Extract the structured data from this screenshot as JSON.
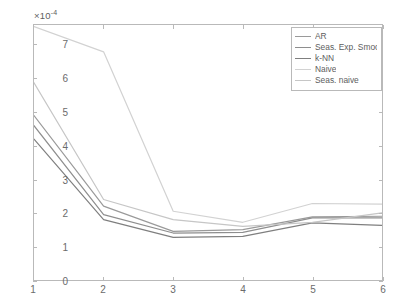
{
  "figure": {
    "title": "",
    "exponent_label": "×10",
    "exponent_value": "-4",
    "background_color": "#ffffff",
    "axis_color": "#b9b9b9"
  },
  "axes": {
    "y_ticks": [
      "0",
      "1",
      "2",
      "3",
      "4",
      "5",
      "6",
      "7"
    ],
    "x_ticks": [
      "1",
      "2",
      "3",
      "4",
      "5",
      "6"
    ],
    "ylabel": "",
    "xlabel": ""
  },
  "legend": {
    "position": "top-right",
    "entries": [
      {
        "label": "AR",
        "color": "#9a9a9a"
      },
      {
        "label": "Seas. Exp. Smooth.",
        "color": "#8e8e8e"
      },
      {
        "label": "k-NN",
        "color": "#7f7f7f"
      },
      {
        "label": "Naive",
        "color": "#d2d2d2"
      },
      {
        "label": "Seas. naive",
        "color": "#c6c6c6"
      }
    ]
  },
  "chart_data": {
    "type": "line",
    "title": "",
    "xlabel": "",
    "ylabel": "",
    "x": [
      1,
      2,
      3,
      4,
      5,
      6
    ],
    "xlim": [
      1,
      6
    ],
    "ylim": [
      0,
      7.6
    ],
    "y_scale_factor": "1e-4",
    "grid": false,
    "legend_position": "top-right",
    "series": [
      {
        "name": "AR",
        "color": "#9a9a9a",
        "values": [
          4.9,
          2.2,
          1.45,
          1.5,
          1.88,
          1.9
        ]
      },
      {
        "name": "Seas. Exp. Smooth.",
        "color": "#8e8e8e",
        "values": [
          4.6,
          1.95,
          1.4,
          1.42,
          1.85,
          1.85
        ]
      },
      {
        "name": "k-NN",
        "color": "#7f7f7f",
        "values": [
          4.2,
          1.8,
          1.27,
          1.3,
          1.7,
          1.63
        ]
      },
      {
        "name": "Naive",
        "color": "#d2d2d2",
        "values": [
          7.55,
          6.8,
          2.05,
          1.72,
          2.28,
          2.26
        ]
      },
      {
        "name": "Seas. naive",
        "color": "#c6c6c6",
        "values": [
          5.88,
          2.4,
          1.8,
          1.6,
          1.72,
          2.0
        ]
      }
    ]
  }
}
